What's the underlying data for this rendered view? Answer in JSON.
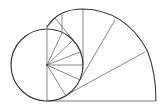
{
  "diagram": {
    "type": "geometric-spiral",
    "stroke_color": "#3a3a3a",
    "thin_stroke_color": "#6a6a6a",
    "circle": {
      "cx": 47,
      "cy": 65,
      "r": 36
    },
    "outer_arc_path": "M47,27 Q58,9 83,9 Q125,10 147,50 Q156,72 156,101",
    "base_line": {
      "x1": 47,
      "y1": 101,
      "x2": 156,
      "y2": 101
    },
    "inner_spokes": [
      {
        "x1": 47,
        "y1": 65,
        "x2": 47,
        "y2": 29
      },
      {
        "x1": 47,
        "y1": 65,
        "x2": 62,
        "y2": 33
      },
      {
        "x1": 47,
        "y1": 65,
        "x2": 73,
        "y2": 40
      },
      {
        "x1": 47,
        "y1": 65,
        "x2": 80,
        "y2": 52
      },
      {
        "x1": 47,
        "y1": 65,
        "x2": 83,
        "y2": 65
      },
      {
        "x1": 47,
        "y1": 65,
        "x2": 80,
        "y2": 80
      },
      {
        "x1": 47,
        "y1": 65,
        "x2": 66,
        "y2": 96
      },
      {
        "x1": 47,
        "y1": 65,
        "x2": 47,
        "y2": 101
      }
    ],
    "outer_spokes": [
      {
        "x1": 47,
        "y1": 29,
        "x2": 47,
        "y2": 25
      },
      {
        "x1": 49,
        "y1": 25,
        "x2": 55,
        "y2": 18
      },
      {
        "x1": 55,
        "y1": 18,
        "x2": 73,
        "y2": 40
      },
      {
        "x1": 62,
        "y1": 14,
        "x2": 62,
        "y2": 33
      },
      {
        "x1": 83,
        "y1": 9,
        "x2": 83,
        "y2": 65
      },
      {
        "x1": 115,
        "y1": 20,
        "x2": 80,
        "y2": 80
      },
      {
        "x1": 145,
        "y1": 52,
        "x2": 70,
        "y2": 93
      }
    ]
  }
}
